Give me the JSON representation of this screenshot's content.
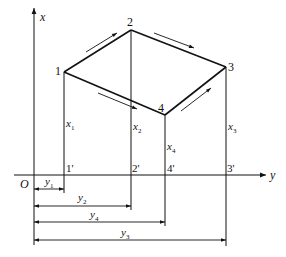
{
  "figure": {
    "axes": {
      "x_axis_label": "x",
      "y_axis_label": "y",
      "origin_label": "O"
    },
    "points": [
      {
        "id": "1",
        "label": "1",
        "foot_label": "1'",
        "height_label": "x",
        "height_sub": "1",
        "dist_label": "y",
        "dist_sub": "1"
      },
      {
        "id": "2",
        "label": "2",
        "foot_label": "2'",
        "height_label": "x",
        "height_sub": "2",
        "dist_label": "y",
        "dist_sub": "2"
      },
      {
        "id": "3",
        "label": "3",
        "foot_label": "3'",
        "height_label": "x",
        "height_sub": "3",
        "dist_label": "y",
        "dist_sub": "3"
      },
      {
        "id": "4",
        "label": "4",
        "foot_label": "4'",
        "height_label": "x",
        "height_sub": "4",
        "dist_label": "y",
        "dist_sub": "4"
      }
    ],
    "edges": [
      "1-2",
      "2-3",
      "3-4",
      "4-1"
    ],
    "flow_arrows": [
      "1→2",
      "2→3",
      "1→4",
      "4→3"
    ],
    "stroke_color": "#111111",
    "background_color": "#ffffff"
  }
}
